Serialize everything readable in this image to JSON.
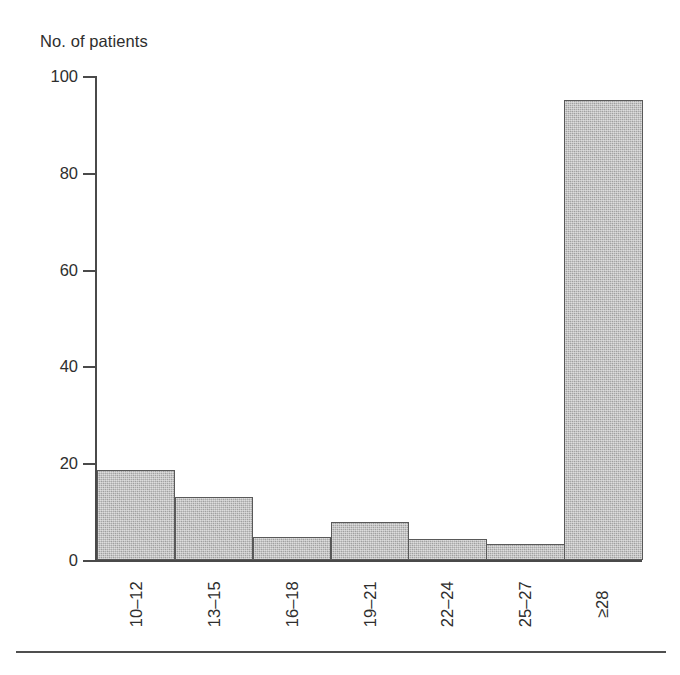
{
  "figure": {
    "y_axis_title": "No. of patients",
    "axis_color": "#4a4a4a",
    "bar_fill_color": "#a9a9a9",
    "bar_edge_color": "#595959",
    "text_color": "#2e2e2e",
    "bottom_rule_color": "#4f4f4f"
  },
  "chart_data": {
    "type": "bar",
    "title": "",
    "subtitle": "",
    "xlabel": "",
    "ylabel": "No. of patients",
    "categories": [
      "10–12",
      "13–15",
      "16–18",
      "19–21",
      "22–24",
      "25–27",
      "≥28"
    ],
    "values": [
      18.5,
      13,
      4.7,
      7.8,
      4.3,
      3.3,
      95
    ],
    "ylim": [
      0,
      100
    ],
    "yticks": [
      0,
      20,
      40,
      60,
      80,
      100
    ],
    "ytick_labels": [
      "0",
      "20",
      "40",
      "60",
      "80",
      "100"
    ],
    "grid": false,
    "legend": null,
    "legend_position": "none",
    "annotations": []
  }
}
